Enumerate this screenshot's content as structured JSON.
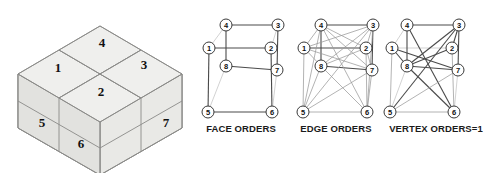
{
  "figure": {
    "background_color": "#ffffff"
  },
  "block_diagram": {
    "name": "isometric-block",
    "description": "Isometric stacked block split into numbered sub-cells",
    "fill_color": "#e9e9e6",
    "stroke_color": "#8a8a88",
    "cells": [
      {
        "id": "1",
        "label": "1",
        "x": 58,
        "y": 67,
        "face": "top"
      },
      {
        "id": "2",
        "label": "2",
        "x": 101,
        "y": 91,
        "face": "top"
      },
      {
        "id": "3",
        "label": "3",
        "x": 144,
        "y": 64,
        "face": "top"
      },
      {
        "id": "4",
        "label": "4",
        "x": 102,
        "y": 42,
        "face": "top"
      },
      {
        "id": "5",
        "label": "5",
        "x": 42,
        "y": 122,
        "face": "front-left"
      },
      {
        "id": "6",
        "label": "6",
        "x": 81,
        "y": 143,
        "face": "front-left"
      },
      {
        "id": "7",
        "label": "7",
        "x": 166,
        "y": 122,
        "face": "front-right"
      }
    ]
  },
  "graphs": [
    {
      "name": "face-orders-graph",
      "caption": "FACE ORDERS",
      "caption_x": 241,
      "caption_y": 132,
      "nodes": [
        {
          "id": "1",
          "label": "1",
          "x": 209,
          "y": 48
        },
        {
          "id": "2",
          "label": "2",
          "x": 271,
          "y": 48
        },
        {
          "id": "3",
          "label": "3",
          "x": 278,
          "y": 25
        },
        {
          "id": "4",
          "label": "4",
          "x": 226,
          "y": 25
        },
        {
          "id": "5",
          "label": "5",
          "x": 208,
          "y": 112
        },
        {
          "id": "6",
          "label": "6",
          "x": 272,
          "y": 112
        },
        {
          "id": "7",
          "label": "7",
          "x": 277,
          "y": 70
        },
        {
          "id": "8",
          "label": "8",
          "x": 226,
          "y": 66
        }
      ],
      "edges": [
        {
          "from": "4",
          "to": "3",
          "weight": "strong"
        },
        {
          "from": "1",
          "to": "2",
          "weight": "strong"
        },
        {
          "from": "8",
          "to": "7",
          "weight": "strong"
        },
        {
          "from": "5",
          "to": "6",
          "weight": "strong"
        },
        {
          "from": "4",
          "to": "8",
          "weight": "strong"
        },
        {
          "from": "3",
          "to": "7",
          "weight": "strong"
        },
        {
          "from": "1",
          "to": "5",
          "weight": "strong"
        },
        {
          "from": "2",
          "to": "6",
          "weight": "strong"
        },
        {
          "from": "1",
          "to": "4",
          "weight": "faint"
        },
        {
          "from": "2",
          "to": "3",
          "weight": "faint"
        },
        {
          "from": "5",
          "to": "8",
          "weight": "faint"
        },
        {
          "from": "6",
          "to": "7",
          "weight": "faint"
        }
      ]
    },
    {
      "name": "edge-orders-graph",
      "caption": "EDGE ORDERS",
      "caption_x": 336,
      "caption_y": 132,
      "nodes": [
        {
          "id": "1",
          "label": "1",
          "x": 304,
          "y": 48
        },
        {
          "id": "2",
          "label": "2",
          "x": 366,
          "y": 48
        },
        {
          "id": "3",
          "label": "3",
          "x": 373,
          "y": 25
        },
        {
          "id": "4",
          "label": "4",
          "x": 321,
          "y": 25
        },
        {
          "id": "5",
          "label": "5",
          "x": 303,
          "y": 112
        },
        {
          "id": "6",
          "label": "6",
          "x": 367,
          "y": 112
        },
        {
          "id": "7",
          "label": "7",
          "x": 372,
          "y": 70
        },
        {
          "id": "8",
          "label": "8",
          "x": 321,
          "y": 66
        }
      ],
      "edges": [
        {
          "from": "4",
          "to": "3",
          "weight": "strong"
        },
        {
          "from": "1",
          "to": "2",
          "weight": "strong"
        },
        {
          "from": "8",
          "to": "7",
          "weight": "strong"
        },
        {
          "from": "5",
          "to": "6",
          "weight": "thin"
        },
        {
          "from": "4",
          "to": "8",
          "weight": "strong"
        },
        {
          "from": "3",
          "to": "7",
          "weight": "strong"
        },
        {
          "from": "1",
          "to": "5",
          "weight": "thin"
        },
        {
          "from": "2",
          "to": "6",
          "weight": "thin"
        },
        {
          "from": "1",
          "to": "4",
          "weight": "thin"
        },
        {
          "from": "2",
          "to": "3",
          "weight": "thin"
        },
        {
          "from": "5",
          "to": "8",
          "weight": "thin"
        },
        {
          "from": "6",
          "to": "7",
          "weight": "thin"
        },
        {
          "from": "4",
          "to": "2",
          "weight": "thin"
        },
        {
          "from": "4",
          "to": "7",
          "weight": "thin"
        },
        {
          "from": "4",
          "to": "6",
          "weight": "thin"
        },
        {
          "from": "4",
          "to": "5",
          "weight": "thin"
        },
        {
          "from": "3",
          "to": "1",
          "weight": "thin"
        },
        {
          "from": "3",
          "to": "8",
          "weight": "thin"
        },
        {
          "from": "3",
          "to": "5",
          "weight": "thin"
        },
        {
          "from": "3",
          "to": "6",
          "weight": "thin"
        },
        {
          "from": "1",
          "to": "8",
          "weight": "thin"
        },
        {
          "from": "1",
          "to": "7",
          "weight": "thin"
        },
        {
          "from": "2",
          "to": "8",
          "weight": "thin"
        },
        {
          "from": "2",
          "to": "7",
          "weight": "thin"
        },
        {
          "from": "8",
          "to": "6",
          "weight": "thin"
        },
        {
          "from": "7",
          "to": "5",
          "weight": "thin"
        }
      ]
    },
    {
      "name": "vertex-orders-graph",
      "caption": "VERTEX ORDERS=1",
      "caption_x": 436,
      "caption_y": 132,
      "nodes": [
        {
          "id": "1",
          "label": "1",
          "x": 392,
          "y": 48
        },
        {
          "id": "2",
          "label": "2",
          "x": 452,
          "y": 48
        },
        {
          "id": "3",
          "label": "3",
          "x": 459,
          "y": 25
        },
        {
          "id": "4",
          "label": "4",
          "x": 407,
          "y": 25
        },
        {
          "id": "5",
          "label": "5",
          "x": 390,
          "y": 112
        },
        {
          "id": "6",
          "label": "6",
          "x": 454,
          "y": 112
        },
        {
          "id": "7",
          "label": "7",
          "x": 458,
          "y": 70
        },
        {
          "id": "8",
          "label": "8",
          "x": 407,
          "y": 66
        }
      ],
      "edges": [
        {
          "from": "4",
          "to": "3",
          "weight": "strong"
        },
        {
          "from": "1",
          "to": "2",
          "weight": "faint"
        },
        {
          "from": "8",
          "to": "7",
          "weight": "strong"
        },
        {
          "from": "5",
          "to": "6",
          "weight": "thin"
        },
        {
          "from": "4",
          "to": "8",
          "weight": "strong"
        },
        {
          "from": "3",
          "to": "7",
          "weight": "strong"
        },
        {
          "from": "1",
          "to": "5",
          "weight": "thin"
        },
        {
          "from": "2",
          "to": "6",
          "weight": "thin"
        },
        {
          "from": "1",
          "to": "4",
          "weight": "faint"
        },
        {
          "from": "2",
          "to": "3",
          "weight": "strong"
        },
        {
          "from": "5",
          "to": "8",
          "weight": "faint"
        },
        {
          "from": "6",
          "to": "7",
          "weight": "faint"
        },
        {
          "from": "1",
          "to": "8",
          "weight": "strong"
        },
        {
          "from": "1",
          "to": "7",
          "weight": "strong"
        },
        {
          "from": "3",
          "to": "8",
          "weight": "strong"
        },
        {
          "from": "3",
          "to": "5",
          "weight": "strong"
        },
        {
          "from": "4",
          "to": "6",
          "weight": "strong"
        },
        {
          "from": "2",
          "to": "8",
          "weight": "strong"
        },
        {
          "from": "8",
          "to": "6",
          "weight": "strong"
        },
        {
          "from": "7",
          "to": "5",
          "weight": "thin"
        }
      ]
    }
  ]
}
